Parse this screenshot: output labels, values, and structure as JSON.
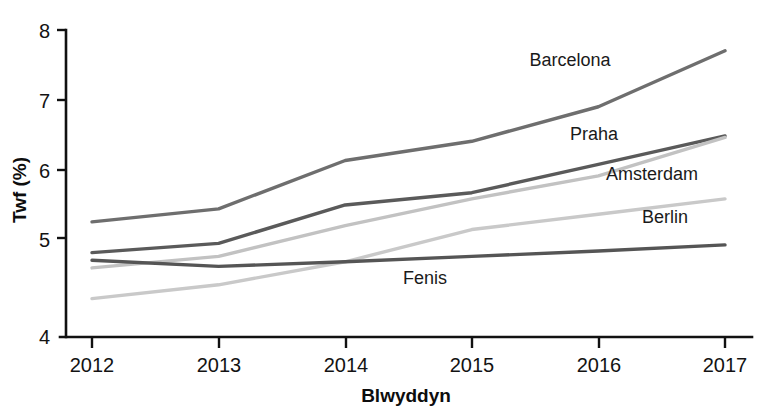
{
  "chart_data": {
    "type": "line",
    "title": "",
    "subtitle": "",
    "xlabel": "Blwyddyn",
    "ylabel": "Twf (%)",
    "x": [
      2012,
      2013,
      2014,
      2015,
      2016,
      2017
    ],
    "xticklabels": [
      "2012",
      "2013",
      "2014",
      "2015",
      "2016",
      "2017"
    ],
    "yticklabels": [
      "4",
      "5",
      "6",
      "7",
      "8"
    ],
    "yticks": [
      4,
      5,
      6,
      7,
      8
    ],
    "xlim": [
      2012,
      2017
    ],
    "ylim": [
      4,
      8
    ],
    "grid": false,
    "legend_position": "inline-right",
    "series": [
      {
        "name": "Barcelona",
        "color": "#6e6e6e",
        "values": [
          5.5,
          5.67,
          6.3,
          6.55,
          7.0,
          7.73
        ]
      },
      {
        "name": "Praha",
        "color": "#5a5a5a",
        "values": [
          5.1,
          5.22,
          5.72,
          5.88,
          6.25,
          6.62
        ]
      },
      {
        "name": "Amsterdam",
        "color": "#c2c2c2",
        "values": [
          4.9,
          5.05,
          5.45,
          5.8,
          6.1,
          6.6
        ]
      },
      {
        "name": "Berlin",
        "color": "#c9c9c9",
        "values": [
          4.5,
          4.68,
          4.98,
          5.4,
          5.6,
          5.8
        ]
      },
      {
        "name": "Fenis",
        "color": "#555555",
        "values": [
          5.0,
          4.92,
          4.98,
          5.05,
          5.12,
          5.2
        ]
      }
    ],
    "annotations": [
      {
        "text": "Barcelona",
        "x": 570,
        "y": 66
      },
      {
        "text": "Praha",
        "x": 594,
        "y": 140
      },
      {
        "text": "Amsterdam",
        "x": 652,
        "y": 180
      },
      {
        "text": "Berlin",
        "x": 665,
        "y": 223
      },
      {
        "text": "Fenis",
        "x": 425,
        "y": 284
      }
    ]
  },
  "axes": {
    "y_title": "Twf (%)",
    "x_title": "Blwyddyn",
    "y_ticks": [
      "8",
      "7",
      "6",
      "5",
      "4"
    ],
    "x_ticks": [
      "2012",
      "2013",
      "2014",
      "2015",
      "2016",
      "2017"
    ]
  }
}
